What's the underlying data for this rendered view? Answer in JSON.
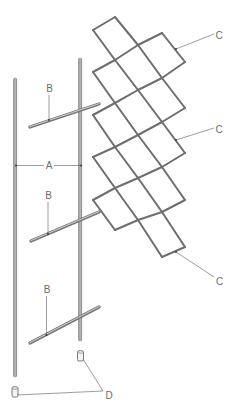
{
  "figure": {
    "colors": {
      "rod": "#8a8a8a",
      "rod_highlight": "#c8c8c8",
      "lattice": "#6e6e6e",
      "leader": "#5a5a5a",
      "label": "#6a6a6a",
      "background": "#ffffff"
    }
  },
  "labels": {
    "A": "A",
    "B1": "B",
    "B2": "B",
    "B3": "B",
    "C1": "C",
    "C2": "C",
    "C3": "C",
    "D": "D"
  },
  "parts": [
    {
      "key": "A",
      "name": "Upright poles (spacing dimension)"
    },
    {
      "key": "B",
      "name": "Cross rods",
      "count": 3
    },
    {
      "key": "C",
      "name": "Diamond lattice panel"
    },
    {
      "key": "D",
      "name": "End caps",
      "count": 2
    }
  ]
}
